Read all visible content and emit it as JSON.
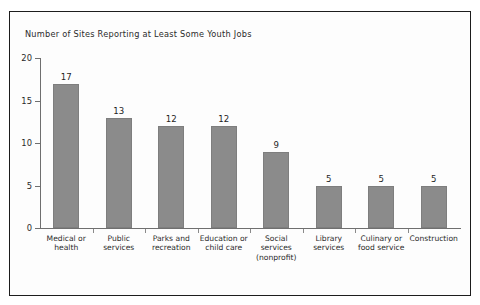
{
  "chart_data": {
    "type": "bar",
    "title": "Number of Sites Reporting at Least Some Youth Jobs",
    "xlabel": "",
    "ylabel": "",
    "ylim": [
      0,
      20
    ],
    "yticks": [
      "0",
      "5",
      "10",
      "15",
      "20"
    ],
    "ytick_values": [
      0,
      5,
      10,
      15,
      20
    ],
    "grid": false,
    "legend": "none",
    "bar_color": "#8b8b8b",
    "categories": [
      "Medical or health",
      "Public services",
      "Parks and recreation",
      "Education or child care",
      "Social services (nonprofit)",
      "Library services",
      "Culinary or food service",
      "Construction"
    ],
    "category_lines": [
      [
        "Medical or",
        "health"
      ],
      [
        "Public",
        "services"
      ],
      [
        "Parks and",
        "recreation"
      ],
      [
        "Education or",
        "child care"
      ],
      [
        "Social",
        "services",
        "(nonprofit)"
      ],
      [
        "Library",
        "services"
      ],
      [
        "Culinary or",
        "food service"
      ],
      [
        "Construction"
      ]
    ],
    "values": [
      17,
      13,
      12,
      12,
      9,
      5,
      5,
      5
    ],
    "value_labels": [
      "17",
      "13",
      "12",
      "12",
      "9",
      "5",
      "5",
      "5"
    ]
  }
}
